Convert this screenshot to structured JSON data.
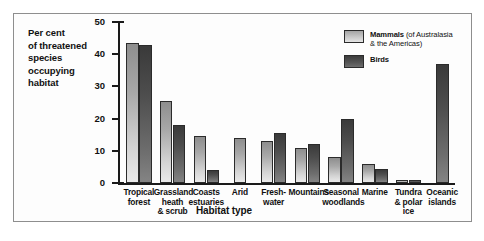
{
  "caption": {
    "lines": [
      "Per cent",
      "of threatened",
      "species",
      "occupying",
      "habitat"
    ]
  },
  "legend": {
    "items": [
      {
        "name": "Mammals",
        "qualifier_line1": " (of Australasia",
        "qualifier_line2": "& the Americas)",
        "swatch": "mammals-swatch",
        "color": "#c8c8c8"
      },
      {
        "name": "Birds",
        "qualifier_line1": "",
        "qualifier_line2": "",
        "swatch": "birds-swatch",
        "color": "#555555"
      }
    ]
  },
  "chart_data": {
    "type": "bar",
    "title": "",
    "xlabel": "Habitat type",
    "ylabel": "Per cent of threatened species occupying habitat",
    "ylim": [
      0,
      50
    ],
    "yticks": [
      0,
      10,
      20,
      30,
      40,
      50
    ],
    "ytick_labels": [
      "0",
      "10",
      "20",
      "30",
      "40",
      "50"
    ],
    "grid": false,
    "legend_position": "top-right",
    "categories": [
      "Tropical forest",
      "Grassland heath & scrub",
      "Coasts estuaries",
      "Arid",
      "Fresh-water",
      "Mountains",
      "Seasonal woodlands",
      "Marine",
      "Tundra & polar ice",
      "Oceanic islands"
    ],
    "category_label_lines": [
      [
        "Tropical",
        "forest"
      ],
      [
        "Grassland",
        "heath",
        "& scrub"
      ],
      [
        "Coasts",
        "estuaries"
      ],
      [
        "Arid"
      ],
      [
        "Fresh-",
        "water"
      ],
      [
        "Mountains"
      ],
      [
        "Seasonal",
        "woodlands"
      ],
      [
        "Marine"
      ],
      [
        "Tundra",
        "& polar",
        "ice"
      ],
      [
        "Oceanic",
        "islands"
      ]
    ],
    "series": [
      {
        "name": "Mammals",
        "values": [
          43.5,
          25.5,
          14.5,
          14.0,
          13.0,
          11.0,
          8.0,
          6.0,
          1.0,
          0
        ]
      },
      {
        "name": "Birds",
        "values": [
          43.0,
          18.0,
          4.0,
          0,
          15.5,
          12.0,
          20.0,
          4.5,
          0.8,
          37.0
        ]
      }
    ]
  }
}
